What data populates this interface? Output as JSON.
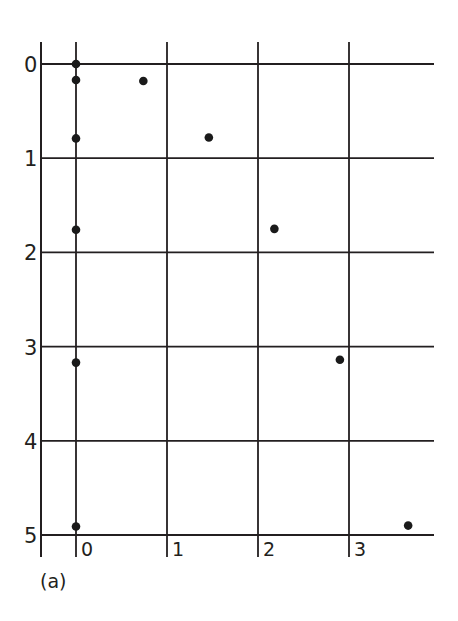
{
  "chart_data": {
    "type": "scatter",
    "title": "",
    "panel_label": "(a)",
    "xlabel": "",
    "ylabel": "",
    "x_ticks": [
      "0",
      "1",
      "2",
      "3"
    ],
    "y_ticks": [
      "0",
      "1",
      "2",
      "3",
      "4",
      "5"
    ],
    "xlim": [
      -0.4,
      3.9
    ],
    "ylim": [
      5.2,
      -0.2
    ],
    "y_axis_inverted": true,
    "grid": true,
    "legend": null,
    "series": [
      {
        "name": "points on x = 0 line",
        "points": [
          {
            "x": 0,
            "y": 0.0
          },
          {
            "x": 0,
            "y": 0.17
          },
          {
            "x": 0,
            "y": 0.79
          },
          {
            "x": 0,
            "y": 1.76
          },
          {
            "x": 0,
            "y": 3.17
          },
          {
            "x": 0,
            "y": 4.91
          }
        ]
      },
      {
        "name": "displaced points",
        "points": [
          {
            "x": 0.74,
            "y": 0.18
          },
          {
            "x": 1.46,
            "y": 0.78
          },
          {
            "x": 2.18,
            "y": 1.75
          },
          {
            "x": 2.9,
            "y": 3.14
          },
          {
            "x": 3.65,
            "y": 4.9
          }
        ]
      }
    ],
    "colors": {
      "line": "#231f20",
      "point": "#1a1a1a",
      "background": "#ffffff"
    }
  }
}
